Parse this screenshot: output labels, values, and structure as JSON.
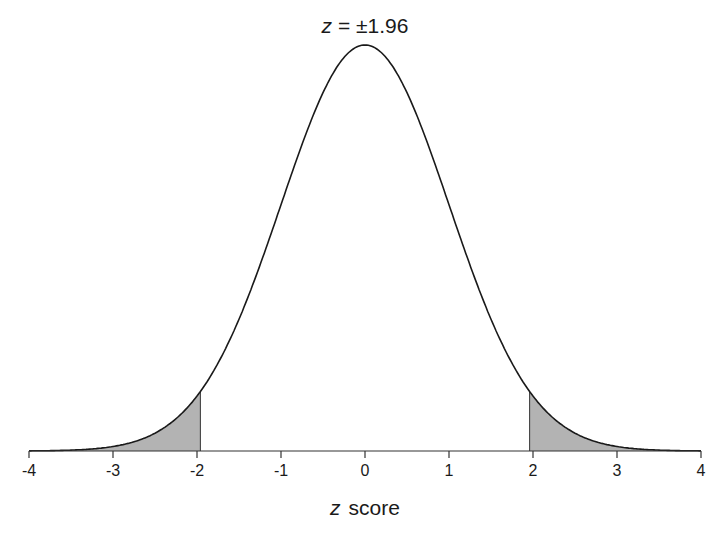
{
  "chart_data": {
    "type": "area",
    "title": "z = ±1.96",
    "title_parts": {
      "variable": "z",
      "rest": "= ±1.96"
    },
    "xlabel": "z score",
    "xlabel_parts": {
      "variable": "z",
      "rest": "score"
    },
    "ylabel": "",
    "xlim": [
      -4,
      4
    ],
    "xticks": [
      -4,
      -3,
      -2,
      -1,
      0,
      1,
      2,
      3,
      4
    ],
    "xtick_labels": [
      "-4",
      "-3",
      "-2",
      "-1",
      "0",
      "1",
      "2",
      "3",
      "4"
    ],
    "grid": false,
    "legend": null,
    "series": [
      {
        "name": "standard normal density",
        "function": "pdf N(0,1)",
        "mean": 0,
        "sd": 1,
        "peak": 0.399
      }
    ],
    "shaded_regions": [
      {
        "from": -4,
        "to": -1.96,
        "label": "lower tail 2.5%"
      },
      {
        "from": 1.96,
        "to": 4,
        "label": "upper tail 2.5%"
      }
    ],
    "critical_values": [
      -1.96,
      1.96
    ],
    "colors": {
      "curve": "#1a1a1a",
      "shade": "#b3b3b3",
      "axis": "#333333"
    }
  }
}
